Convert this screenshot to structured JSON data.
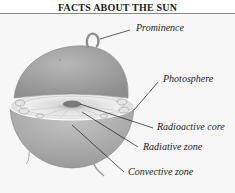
{
  "title": "FACTS ABOUT THE SUN",
  "diagram": {
    "labels": [
      {
        "id": "prominence",
        "text": "Prominence"
      },
      {
        "id": "photosphere",
        "text": "Photosphere"
      },
      {
        "id": "radioactive-core",
        "text": "Radioactive core"
      },
      {
        "id": "radiative-zone",
        "text": "Radiative zone"
      },
      {
        "id": "convective-zone",
        "text": "Convective zone"
      }
    ],
    "colors": {
      "sun_surface": "#a9a9a9",
      "interior": "#e6e6e6",
      "core": "#7a7a7a",
      "leader_line": "#1a1a1a",
      "rule": "#8a8a8a"
    }
  }
}
